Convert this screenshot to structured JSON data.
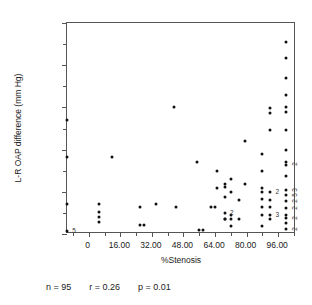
{
  "chart_data": {
    "type": "scatter",
    "title": "",
    "xlabel": "%Stenosis",
    "ylabel": "L-R OAP difference (mm Hg)",
    "xlim": [
      -11,
      105
    ],
    "ylim": [
      0,
      60
    ],
    "grid": false,
    "legend": null,
    "xticks": [
      "0",
      "16.00",
      "32.00",
      "48.00",
      "64.00",
      "80.00",
      "96.00"
    ],
    "xtick_values": [
      0,
      16,
      32,
      48,
      64,
      80,
      96
    ],
    "yticks": [
      "0",
      "12.00",
      "24.00",
      "36.00",
      "48.00",
      "60.00"
    ],
    "ytick_values": [
      0,
      12,
      24,
      36,
      48,
      60
    ],
    "marker": "filled-circle",
    "marker_color": "#111111",
    "points": [
      [
        -11,
        32.5
      ],
      [
        -11,
        21.8
      ],
      [
        -11,
        8.5
      ],
      [
        -11,
        0.8
      ],
      [
        5,
        8.5
      ],
      [
        5,
        6.2
      ],
      [
        5,
        4.9
      ],
      [
        5,
        3.5
      ],
      [
        12,
        21.8
      ],
      [
        26,
        7.8
      ],
      [
        26,
        2.5
      ],
      [
        28,
        2.5
      ],
      [
        34,
        8.5
      ],
      [
        43,
        36.0
      ],
      [
        44,
        7.8
      ],
      [
        55,
        20.5
      ],
      [
        56,
        1.2
      ],
      [
        58,
        1.2
      ],
      [
        62,
        7.8
      ],
      [
        64,
        7.8
      ],
      [
        65,
        18.0
      ],
      [
        65,
        13.2
      ],
      [
        69,
        13.5
      ],
      [
        69,
        14.2
      ],
      [
        69,
        10.5
      ],
      [
        69,
        6.0
      ],
      [
        69,
        4.3
      ],
      [
        69,
        4.3
      ],
      [
        72,
        15.5
      ],
      [
        72,
        12.0
      ],
      [
        72,
        5.5
      ],
      [
        72,
        4.3
      ],
      [
        72,
        2.3
      ],
      [
        76,
        9.8
      ],
      [
        76,
        4.3
      ],
      [
        79,
        14.2
      ],
      [
        79,
        26.5
      ],
      [
        88,
        22.8
      ],
      [
        88,
        18.0
      ],
      [
        88,
        13.2
      ],
      [
        88,
        12.0
      ],
      [
        88,
        10.0
      ],
      [
        88,
        7.8
      ],
      [
        88,
        5.5
      ],
      [
        88,
        2.3
      ],
      [
        92,
        35.8
      ],
      [
        92,
        34.5
      ],
      [
        92,
        29.5
      ],
      [
        92,
        12.0
      ],
      [
        92,
        9.8
      ],
      [
        92,
        7.8
      ],
      [
        92,
        5.5
      ],
      [
        92,
        4.3
      ],
      [
        100,
        54.5
      ],
      [
        100,
        50.0
      ],
      [
        100,
        44.5
      ],
      [
        100,
        39.5
      ],
      [
        100,
        36.0
      ],
      [
        100,
        34.8
      ],
      [
        100,
        29.5
      ],
      [
        100,
        24.0
      ],
      [
        100,
        20.5
      ],
      [
        100,
        19.5
      ],
      [
        100,
        16.5
      ],
      [
        100,
        12.5
      ],
      [
        100,
        11.0
      ],
      [
        100,
        9.5
      ],
      [
        100,
        7.5
      ],
      [
        100,
        5.5
      ],
      [
        100,
        4.5
      ],
      [
        100,
        3.0
      ],
      [
        100,
        1.5
      ]
    ],
    "overlap_labels": [
      {
        "x": -11,
        "y": 0.8,
        "count": "5"
      },
      {
        "x": 69,
        "y": 6.0,
        "count": "2"
      },
      {
        "x": 92,
        "y": 12.0,
        "count": "2"
      },
      {
        "x": 92,
        "y": 5.5,
        "count": "3"
      },
      {
        "x": 100,
        "y": 20.0,
        "count": "2"
      },
      {
        "x": 100,
        "y": 12.5,
        "count": "3"
      },
      {
        "x": 100,
        "y": 11.0,
        "count": "5"
      },
      {
        "x": 100,
        "y": 9.5,
        "count": "2"
      },
      {
        "x": 100,
        "y": 7.5,
        "count": "2"
      },
      {
        "x": 100,
        "y": 4.5,
        "count": "2"
      },
      {
        "x": 100,
        "y": 1.5,
        "count": "2"
      }
    ]
  },
  "stats": {
    "n_label": "n = 95",
    "r_label": "r = 0.26",
    "p_label": "p = 0.01"
  }
}
